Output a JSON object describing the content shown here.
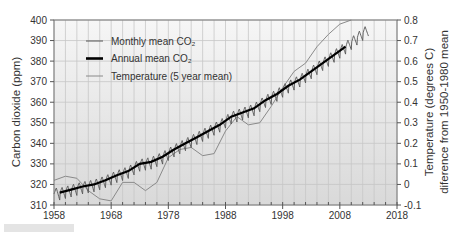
{
  "chart_data": {
    "type": "line",
    "title": "",
    "xlabel": "",
    "ylabel": "Carbon dioxide (ppm)",
    "ylabel_right": "Temperature (degrees C) difference from 1950-1980 mean",
    "ylabel_right_lines": [
      "Temperature (degrees C)",
      "diference  from 1950-1980 mean"
    ],
    "xlim": [
      1958,
      2018
    ],
    "ylim": [
      310,
      400
    ],
    "ylim_right": [
      -0.1,
      0.8
    ],
    "x_ticks": [
      1958,
      1968,
      1978,
      1988,
      1998,
      2008,
      2018
    ],
    "y_ticks": [
      310,
      320,
      330,
      340,
      350,
      360,
      370,
      380,
      390,
      400
    ],
    "y_ticks_right": [
      -0.1,
      0,
      0.1,
      0.2,
      0.3,
      0.4,
      0.5,
      0.6,
      0.7,
      0.8
    ],
    "grid": true,
    "legend_position": "upper-left",
    "legend": [
      {
        "label": "Monthly mean CO₂",
        "style": "thin-dark"
      },
      {
        "label": "Annual  mean  CO₂",
        "style": "thick-black"
      },
      {
        "label": "Temperature (5 year mean)",
        "style": "thin-gray"
      }
    ],
    "series": [
      {
        "name": "Annual mean CO2",
        "axis": "left",
        "x": [
          1959,
          1961,
          1963,
          1965,
          1967,
          1969,
          1971,
          1973,
          1975,
          1977,
          1979,
          1981,
          1983,
          1985,
          1987,
          1989,
          1991,
          1993,
          1995,
          1997,
          1999,
          2001,
          2003,
          2005,
          2007,
          2009
        ],
        "values": [
          316,
          317.5,
          319,
          320,
          322,
          324.5,
          326.5,
          330,
          331,
          333.5,
          337,
          340,
          343,
          346,
          349,
          353,
          355,
          357,
          361,
          364,
          368,
          371,
          375,
          379,
          383,
          387
        ]
      },
      {
        "name": "Monthly mean CO2",
        "axis": "left",
        "seasonal_amplitude_ppm": 3,
        "x_range": [
          1958,
          2013
        ],
        "end_value": 400
      },
      {
        "name": "Temperature (5 year mean)",
        "axis": "right",
        "x": [
          1958,
          1960,
          1962,
          1964,
          1966,
          1968,
          1970,
          1972,
          1974,
          1976,
          1978,
          1980,
          1982,
          1984,
          1986,
          1988,
          1990,
          1992,
          1994,
          1996,
          1998,
          2000,
          2002,
          2004,
          2006,
          2008,
          2010
        ],
        "values": [
          0.02,
          0.04,
          0.03,
          -0.03,
          -0.07,
          -0.08,
          0.01,
          0.01,
          -0.03,
          0.01,
          0.13,
          0.17,
          0.18,
          0.14,
          0.15,
          0.26,
          0.33,
          0.29,
          0.3,
          0.38,
          0.47,
          0.55,
          0.59,
          0.67,
          0.73,
          0.78,
          0.8
        ]
      }
    ]
  },
  "caption_fragment": "FIGURE 15.17"
}
